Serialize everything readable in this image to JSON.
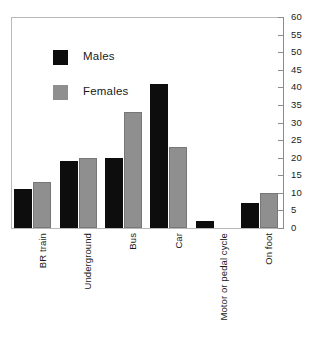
{
  "chart_data": {
    "type": "bar",
    "title": "",
    "subtitle": "",
    "xlabel": "",
    "ylabel": "",
    "categories": [
      "BR train",
      "Underground",
      "Bus",
      "Car",
      "Motor or pedal cycle",
      "On foot"
    ],
    "series": [
      {
        "name": "Males",
        "color": "#0d0d0d",
        "values": [
          11,
          19,
          20,
          41,
          2,
          7
        ]
      },
      {
        "name": "Females",
        "color": "#8f8f8f",
        "values": [
          13,
          20,
          33,
          23,
          0,
          10
        ]
      }
    ],
    "ylim": [
      0,
      60
    ],
    "ytick_step": 5,
    "yticks": [
      0,
      5,
      10,
      15,
      20,
      25,
      30,
      35,
      40,
      45,
      50,
      55,
      60
    ],
    "ytick_labels": [
      "0",
      "5",
      "10",
      "15",
      "20",
      "25",
      "30",
      "35",
      "40",
      "45",
      "50",
      "55",
      "60"
    ],
    "yaxis_position": "right",
    "grid": false,
    "legend_position": "upper-left-inside",
    "legend_entries": [
      "Males",
      "Females"
    ],
    "xtick_rotation": -90
  },
  "colors": {
    "males": "#0d0d0d",
    "females": "#8f8f8f",
    "axis": "#8c8c8c",
    "frame": "#b8b8b8",
    "text": "#1a1a1a",
    "background": "#ffffff"
  }
}
